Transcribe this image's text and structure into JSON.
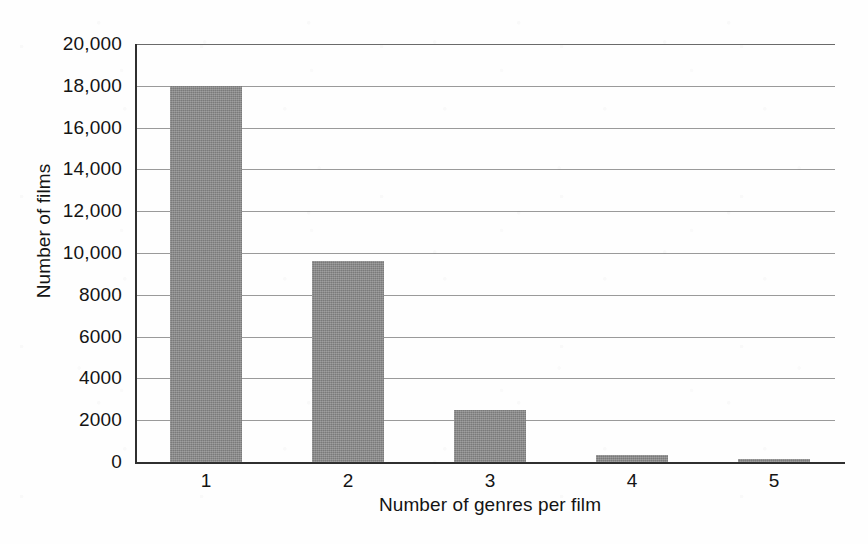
{
  "chart_data": {
    "type": "bar",
    "title": "",
    "xlabel": "Number of genres per film",
    "ylabel": "Number of films",
    "categories": [
      "1",
      "2",
      "3",
      "4",
      "5"
    ],
    "values": [
      18000,
      9600,
      2500,
      350,
      100
    ],
    "ylim": [
      0,
      20000
    ],
    "ytick_values": [
      0,
      2000,
      4000,
      6000,
      8000,
      10000,
      12000,
      14000,
      16000,
      18000,
      20000
    ],
    "ytick_labels": [
      "0",
      "2000",
      "4000",
      "6000",
      "8000",
      "10,000",
      "12,000",
      "14,000",
      "16,000",
      "18,000",
      "20,000"
    ],
    "grid": true,
    "legend": false,
    "bar_color": "#8b8b8b",
    "axis_color": "#2f2f2f",
    "grid_color": "#9a9a9a",
    "background_color": "#fefefe"
  }
}
